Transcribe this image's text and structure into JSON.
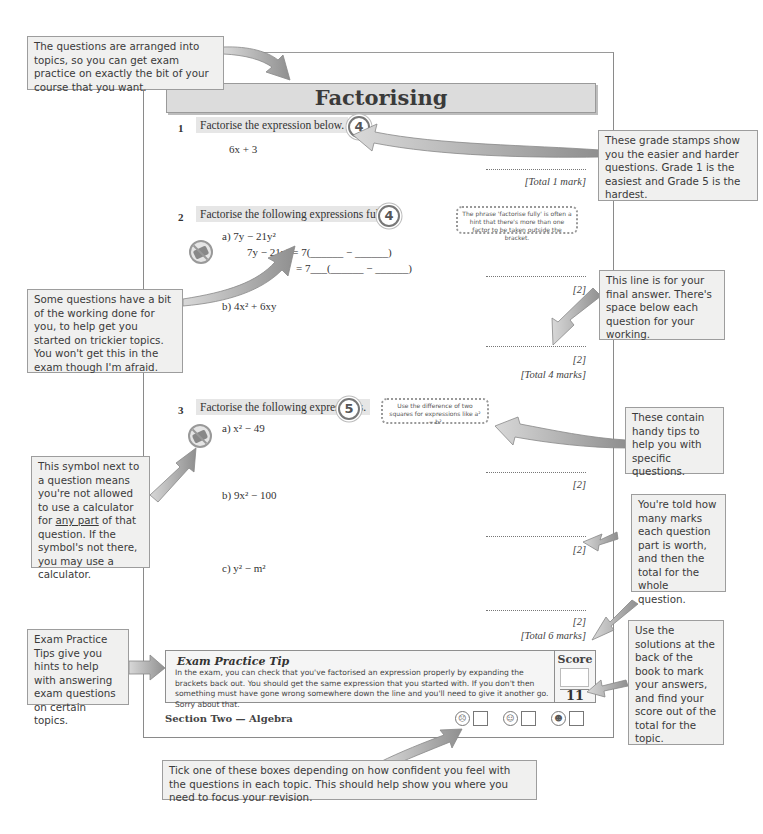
{
  "page": {
    "title": "Factorising",
    "footer_section": "Section Two — Algebra"
  },
  "questions": [
    {
      "number": "1",
      "text": "Factorise the expression below.",
      "grade": "4",
      "expression": "6x + 3",
      "marks": [
        "[Total 1 mark]"
      ]
    },
    {
      "number": "2",
      "text": "Factorise the following expressions fully.",
      "grade": "4",
      "tip": "The phrase 'factorise fully' is often a hint that there's more than one factor to be taken outside the bracket.",
      "parts": [
        {
          "label": "a)",
          "expression": "7y − 21y²",
          "working": [
            "7y − 21y² = 7(______ − ______)",
            "= 7___(______ − ______)"
          ],
          "mark": "[2]"
        },
        {
          "label": "b)",
          "expression": "4x² + 6xy",
          "mark": "[2]"
        }
      ],
      "total": "[Total 4 marks]"
    },
    {
      "number": "3",
      "text": "Factorise the following expressions.",
      "grade": "5",
      "tip": "Use the difference of two squares for expressions like a² − b²",
      "parts": [
        {
          "label": "a)",
          "expression": "x² − 49",
          "mark": "[2]"
        },
        {
          "label": "b)",
          "expression": "9x² − 100",
          "mark": "[2]"
        },
        {
          "label": "c)",
          "expression": "y² − m²",
          "mark": "[2]"
        }
      ],
      "total": "[Total 6 marks]"
    }
  ],
  "exam_tip": {
    "title": "Exam Practice Tip",
    "body": "In the exam, you can check that you've factorised an expression properly by expanding the brackets back out.  You should get the same expression that you started with.  If you don't then something must have gone wrong somewhere down the line and you'll need to give it another go.  Sorry about that.",
    "score_label": "Score",
    "score_total": "11"
  },
  "confidence": [
    {
      "icon": "worried-face-icon",
      "glyph": "☹"
    },
    {
      "icon": "neutral-face-icon",
      "glyph": "☺"
    },
    {
      "icon": "winking-face-icon",
      "glyph": "☻"
    }
  ],
  "callouts": {
    "topics": "The questions are arranged into topics, so you can get exam practice on exactly the bit of your course that you want.",
    "grade_stamps": "These grade stamps show you the easier and harder questions.  Grade 1 is the easiest and Grade 5 is the hardest.",
    "working": "Some questions have a bit of the working done for you, to help get you started on trickier topics.  You won't get this in the exam though I'm afraid.",
    "final_answer": "This line is for your final answer.  There's space below each question for your working.",
    "tips": "These contain handy tips to help you with specific questions.",
    "calculator_before": "This symbol next to a question means you're not allowed to use a calculator for ",
    "calculator_underline": "any part",
    "calculator_after": " of that question.  If the symbol's not there, you may use a calculator.",
    "marks": "You're told how many marks each question part is worth, and then the total for the whole question.",
    "exam_tips": "Exam Practice Tips give you hints to help with answering exam questions on certain topics.",
    "solutions": "Use the solutions at the back of the book to mark your answers, and find your score out of the total for the topic.",
    "confidence": "Tick one of these boxes depending on how confident you feel with the questions in each topic.  This should help show you where you need to focus your revision."
  },
  "colors": {
    "callout_bg": "#f0f0ef",
    "title_bar_bg": "#dcdcdc",
    "arrow": "#9a9a9a"
  }
}
